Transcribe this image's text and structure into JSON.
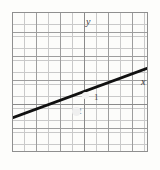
{
  "figure": {
    "kind": "coordinate-grid-line-plot",
    "background_color": "#fdfdfb",
    "border_color": "#8f8f8f",
    "grid_minor_color": "#c9c9c9",
    "grid_major_color": "#9d9d9d",
    "line_color": "#111111",
    "axis_color": "#8a8a8a",
    "labels": {
      "y_axis": "y",
      "x_axis": "x"
    },
    "tick_labels": {
      "x_one": "1",
      "y_neg_two": "-2"
    }
  },
  "chart_data": {
    "type": "line",
    "title": "",
    "xlabel": "x",
    "ylabel": "y",
    "grid": true,
    "legend": null,
    "xlim": [
      -6,
      5.3
    ],
    "ylim": [
      -4.3,
      7.3
    ],
    "x_tick_labels": [
      "1"
    ],
    "y_tick_labels": [
      "-2"
    ],
    "cells_x": 11,
    "cells_y": 12,
    "cell_size_px": 12,
    "major_every_cells": 2,
    "series": [
      {
        "name": "line",
        "x": [
          -6,
          5.3
        ],
        "y": [
          -2.2,
          2.0
        ],
        "slope": 0.37,
        "intercept": 0.0,
        "endpoints_px": [
          [
            0,
            106
          ],
          [
            136,
            56
          ]
        ]
      }
    ]
  }
}
